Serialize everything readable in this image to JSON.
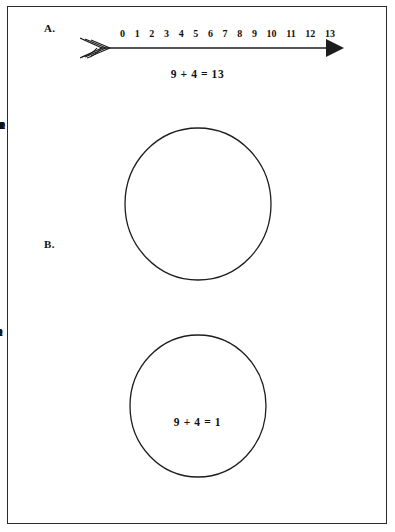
{
  "figure": {
    "background_color": "#ffffff",
    "ink_color": "#111111",
    "border_color": "#2b2b2b"
  },
  "panels": {
    "a": {
      "label": "A.",
      "kind": "number-line",
      "equation": "9 + 4 = 13",
      "tick_labels": [
        "0",
        "1",
        "2",
        "3",
        "4",
        "5",
        "6",
        "7",
        "8",
        "9",
        "10",
        "11",
        "12",
        "13"
      ],
      "left_end": "fletched-tail",
      "right_end": "solid-arrowhead"
    },
    "b": {
      "label": "B.",
      "kind": "clock-circle",
      "equation": "9 + 4 = 1",
      "numerals": [
        {
          "text": "12",
          "angle_deg": 0
        },
        {
          "text": "1",
          "angle_deg": 30
        },
        {
          "text": "2",
          "angle_deg": 60
        },
        {
          "text": "3",
          "angle_deg": 90
        },
        {
          "text": "4",
          "angle_deg": 120
        },
        {
          "text": "5",
          "angle_deg": 150
        },
        {
          "text": "6",
          "angle_deg": 180
        },
        {
          "text": "7",
          "angle_deg": 210
        },
        {
          "text": "8",
          "angle_deg": 240
        },
        {
          "text": "9",
          "angle_deg": 270
        },
        {
          "text": "10",
          "angle_deg": 300
        },
        {
          "text": "11",
          "angle_deg": 330
        }
      ]
    },
    "c": {
      "label": "C.",
      "kind": "mod3-circle",
      "equation": "2 + 2 = 1",
      "numerals": [
        {
          "text": "0",
          "angle_deg": 0
        },
        {
          "text": "1",
          "angle_deg": 120
        },
        {
          "text": "2",
          "angle_deg": 240
        }
      ]
    }
  }
}
